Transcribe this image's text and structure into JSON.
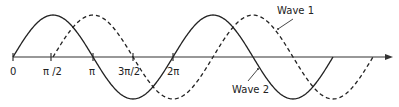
{
  "diagram": {
    "type": "phase-shifted sine waves",
    "axis": {
      "color": "#333333",
      "arrow": true
    },
    "ticks": [
      {
        "label": "0",
        "x": 13
      },
      {
        "label": "π /2",
        "x": 51
      },
      {
        "label": "π",
        "x": 93
      },
      {
        "label": "3π/2",
        "x": 133
      },
      {
        "label": "2π",
        "x": 173
      }
    ],
    "waves": [
      {
        "name": "Wave 1",
        "style": "dashed",
        "start_phase": "π/2",
        "label_pos": [
          277,
          13
        ]
      },
      {
        "name": "Wave 2",
        "style": "solid",
        "start_phase": "0",
        "label_pos": [
          232,
          93
        ]
      }
    ],
    "labels": {
      "wave1": "Wave 1",
      "wave2": "Wave 2"
    }
  }
}
